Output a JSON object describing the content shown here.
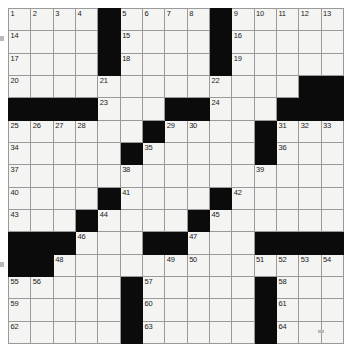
{
  "document": {
    "type": "crossword-puzzle-grid",
    "title": "Crossword Puzzle Grid",
    "columns": 15,
    "rows": 15,
    "colors": {
      "block": "#0b0b0b",
      "cell": "#f4f4f2",
      "gridline": "#9a9a9a",
      "number": "#1a1a1a",
      "page": "#ffffff"
    },
    "clue_count": 64
  },
  "grid": {
    "rows": [
      [
        {
          "block": false,
          "num": "1"
        },
        {
          "block": false,
          "num": "2"
        },
        {
          "block": false,
          "num": "3"
        },
        {
          "block": false,
          "num": "4"
        },
        {
          "block": true,
          "num": ""
        },
        {
          "block": false,
          "num": "5"
        },
        {
          "block": false,
          "num": "6"
        },
        {
          "block": false,
          "num": "7"
        },
        {
          "block": false,
          "num": "8"
        },
        {
          "block": true,
          "num": ""
        },
        {
          "block": false,
          "num": "9"
        },
        {
          "block": false,
          "num": "10"
        },
        {
          "block": false,
          "num": "11"
        },
        {
          "block": false,
          "num": "12"
        },
        {
          "block": false,
          "num": "13"
        }
      ],
      [
        {
          "block": false,
          "num": "14"
        },
        {
          "block": false,
          "num": ""
        },
        {
          "block": false,
          "num": ""
        },
        {
          "block": false,
          "num": ""
        },
        {
          "block": true,
          "num": ""
        },
        {
          "block": false,
          "num": "15"
        },
        {
          "block": false,
          "num": ""
        },
        {
          "block": false,
          "num": ""
        },
        {
          "block": false,
          "num": ""
        },
        {
          "block": true,
          "num": ""
        },
        {
          "block": false,
          "num": "16"
        },
        {
          "block": false,
          "num": ""
        },
        {
          "block": false,
          "num": ""
        },
        {
          "block": false,
          "num": ""
        },
        {
          "block": false,
          "num": ""
        }
      ],
      [
        {
          "block": false,
          "num": "17"
        },
        {
          "block": false,
          "num": ""
        },
        {
          "block": false,
          "num": ""
        },
        {
          "block": false,
          "num": ""
        },
        {
          "block": true,
          "num": ""
        },
        {
          "block": false,
          "num": "18"
        },
        {
          "block": false,
          "num": ""
        },
        {
          "block": false,
          "num": ""
        },
        {
          "block": false,
          "num": ""
        },
        {
          "block": true,
          "num": ""
        },
        {
          "block": false,
          "num": "19"
        },
        {
          "block": false,
          "num": ""
        },
        {
          "block": false,
          "num": ""
        },
        {
          "block": false,
          "num": ""
        },
        {
          "block": false,
          "num": ""
        }
      ],
      [
        {
          "block": false,
          "num": "20"
        },
        {
          "block": false,
          "num": ""
        },
        {
          "block": false,
          "num": ""
        },
        {
          "block": false,
          "num": ""
        },
        {
          "block": false,
          "num": "21"
        },
        {
          "block": false,
          "num": ""
        },
        {
          "block": false,
          "num": ""
        },
        {
          "block": false,
          "num": ""
        },
        {
          "block": false,
          "num": ""
        },
        {
          "block": false,
          "num": "22"
        },
        {
          "block": false,
          "num": ""
        },
        {
          "block": false,
          "num": ""
        },
        {
          "block": false,
          "num": ""
        },
        {
          "block": true,
          "num": ""
        },
        {
          "block": true,
          "num": ""
        }
      ],
      [
        {
          "block": true,
          "num": ""
        },
        {
          "block": true,
          "num": ""
        },
        {
          "block": true,
          "num": ""
        },
        {
          "block": true,
          "num": ""
        },
        {
          "block": false,
          "num": "23"
        },
        {
          "block": false,
          "num": ""
        },
        {
          "block": false,
          "num": ""
        },
        {
          "block": true,
          "num": ""
        },
        {
          "block": true,
          "num": ""
        },
        {
          "block": false,
          "num": "24"
        },
        {
          "block": false,
          "num": ""
        },
        {
          "block": false,
          "num": ""
        },
        {
          "block": true,
          "num": ""
        },
        {
          "block": true,
          "num": ""
        },
        {
          "block": true,
          "num": ""
        }
      ],
      [
        {
          "block": false,
          "num": "25"
        },
        {
          "block": false,
          "num": "26"
        },
        {
          "block": false,
          "num": "27"
        },
        {
          "block": false,
          "num": "28"
        },
        {
          "block": false,
          "num": ""
        },
        {
          "block": false,
          "num": ""
        },
        {
          "block": true,
          "num": ""
        },
        {
          "block": false,
          "num": "29"
        },
        {
          "block": false,
          "num": "30"
        },
        {
          "block": false,
          "num": ""
        },
        {
          "block": false,
          "num": ""
        },
        {
          "block": true,
          "num": ""
        },
        {
          "block": false,
          "num": "31"
        },
        {
          "block": false,
          "num": "32"
        },
        {
          "block": false,
          "num": "33"
        }
      ],
      [
        {
          "block": false,
          "num": "34"
        },
        {
          "block": false,
          "num": ""
        },
        {
          "block": false,
          "num": ""
        },
        {
          "block": false,
          "num": ""
        },
        {
          "block": false,
          "num": ""
        },
        {
          "block": true,
          "num": ""
        },
        {
          "block": false,
          "num": "35"
        },
        {
          "block": false,
          "num": ""
        },
        {
          "block": false,
          "num": ""
        },
        {
          "block": false,
          "num": ""
        },
        {
          "block": false,
          "num": ""
        },
        {
          "block": true,
          "num": ""
        },
        {
          "block": false,
          "num": "36"
        },
        {
          "block": false,
          "num": ""
        },
        {
          "block": false,
          "num": ""
        }
      ],
      [
        {
          "block": false,
          "num": "37"
        },
        {
          "block": false,
          "num": ""
        },
        {
          "block": false,
          "num": ""
        },
        {
          "block": false,
          "num": ""
        },
        {
          "block": false,
          "num": ""
        },
        {
          "block": false,
          "num": "38"
        },
        {
          "block": false,
          "num": ""
        },
        {
          "block": false,
          "num": ""
        },
        {
          "block": false,
          "num": ""
        },
        {
          "block": false,
          "num": ""
        },
        {
          "block": false,
          "num": ""
        },
        {
          "block": false,
          "num": "39"
        },
        {
          "block": false,
          "num": ""
        },
        {
          "block": false,
          "num": ""
        },
        {
          "block": false,
          "num": ""
        }
      ],
      [
        {
          "block": false,
          "num": "40"
        },
        {
          "block": false,
          "num": ""
        },
        {
          "block": false,
          "num": ""
        },
        {
          "block": false,
          "num": ""
        },
        {
          "block": true,
          "num": ""
        },
        {
          "block": false,
          "num": "41"
        },
        {
          "block": false,
          "num": ""
        },
        {
          "block": false,
          "num": ""
        },
        {
          "block": false,
          "num": ""
        },
        {
          "block": true,
          "num": ""
        },
        {
          "block": false,
          "num": "42"
        },
        {
          "block": false,
          "num": ""
        },
        {
          "block": false,
          "num": ""
        },
        {
          "block": false,
          "num": ""
        },
        {
          "block": false,
          "num": ""
        }
      ],
      [
        {
          "block": false,
          "num": "43"
        },
        {
          "block": false,
          "num": ""
        },
        {
          "block": false,
          "num": ""
        },
        {
          "block": true,
          "num": ""
        },
        {
          "block": false,
          "num": "44"
        },
        {
          "block": false,
          "num": ""
        },
        {
          "block": false,
          "num": ""
        },
        {
          "block": false,
          "num": ""
        },
        {
          "block": true,
          "num": ""
        },
        {
          "block": false,
          "num": "45"
        },
        {
          "block": false,
          "num": ""
        },
        {
          "block": false,
          "num": ""
        },
        {
          "block": false,
          "num": ""
        },
        {
          "block": false,
          "num": ""
        },
        {
          "block": false,
          "num": ""
        }
      ],
      [
        {
          "block": true,
          "num": ""
        },
        {
          "block": true,
          "num": ""
        },
        {
          "block": true,
          "num": ""
        },
        {
          "block": false,
          "num": "46"
        },
        {
          "block": false,
          "num": ""
        },
        {
          "block": false,
          "num": ""
        },
        {
          "block": true,
          "num": ""
        },
        {
          "block": true,
          "num": ""
        },
        {
          "block": false,
          "num": "47"
        },
        {
          "block": false,
          "num": ""
        },
        {
          "block": false,
          "num": ""
        },
        {
          "block": true,
          "num": ""
        },
        {
          "block": true,
          "num": ""
        },
        {
          "block": true,
          "num": ""
        },
        {
          "block": true,
          "num": ""
        }
      ],
      [
        {
          "block": true,
          "num": ""
        },
        {
          "block": true,
          "num": ""
        },
        {
          "block": false,
          "num": "48"
        },
        {
          "block": false,
          "num": ""
        },
        {
          "block": false,
          "num": ""
        },
        {
          "block": false,
          "num": ""
        },
        {
          "block": false,
          "num": ""
        },
        {
          "block": false,
          "num": "49"
        },
        {
          "block": false,
          "num": "50"
        },
        {
          "block": false,
          "num": ""
        },
        {
          "block": false,
          "num": ""
        },
        {
          "block": false,
          "num": "51"
        },
        {
          "block": false,
          "num": "52"
        },
        {
          "block": false,
          "num": "53"
        },
        {
          "block": false,
          "num": "54"
        }
      ],
      [
        {
          "block": false,
          "num": "55"
        },
        {
          "block": false,
          "num": "56"
        },
        {
          "block": false,
          "num": ""
        },
        {
          "block": false,
          "num": ""
        },
        {
          "block": false,
          "num": ""
        },
        {
          "block": true,
          "num": ""
        },
        {
          "block": false,
          "num": "57"
        },
        {
          "block": false,
          "num": ""
        },
        {
          "block": false,
          "num": ""
        },
        {
          "block": false,
          "num": ""
        },
        {
          "block": false,
          "num": ""
        },
        {
          "block": true,
          "num": ""
        },
        {
          "block": false,
          "num": "58"
        },
        {
          "block": false,
          "num": ""
        },
        {
          "block": false,
          "num": ""
        }
      ],
      [
        {
          "block": false,
          "num": "59"
        },
        {
          "block": false,
          "num": ""
        },
        {
          "block": false,
          "num": ""
        },
        {
          "block": false,
          "num": ""
        },
        {
          "block": false,
          "num": ""
        },
        {
          "block": true,
          "num": ""
        },
        {
          "block": false,
          "num": "60"
        },
        {
          "block": false,
          "num": ""
        },
        {
          "block": false,
          "num": ""
        },
        {
          "block": false,
          "num": ""
        },
        {
          "block": false,
          "num": ""
        },
        {
          "block": true,
          "num": ""
        },
        {
          "block": false,
          "num": "61"
        },
        {
          "block": false,
          "num": ""
        },
        {
          "block": false,
          "num": ""
        }
      ],
      [
        {
          "block": false,
          "num": "62"
        },
        {
          "block": false,
          "num": ""
        },
        {
          "block": false,
          "num": ""
        },
        {
          "block": false,
          "num": ""
        },
        {
          "block": false,
          "num": ""
        },
        {
          "block": true,
          "num": ""
        },
        {
          "block": false,
          "num": "63"
        },
        {
          "block": false,
          "num": ""
        },
        {
          "block": false,
          "num": ""
        },
        {
          "block": false,
          "num": ""
        },
        {
          "block": false,
          "num": ""
        },
        {
          "block": true,
          "num": ""
        },
        {
          "block": false,
          "num": "64"
        },
        {
          "block": false,
          "num": ""
        },
        {
          "block": false,
          "num": ""
        }
      ]
    ]
  }
}
